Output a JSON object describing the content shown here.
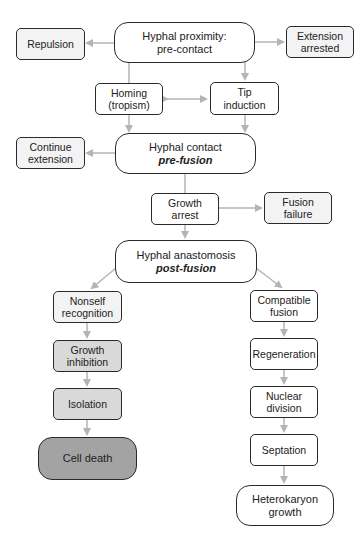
{
  "diagram": {
    "colors": {
      "arrow": "#b4b4b4",
      "border": "#2a2a2a",
      "fill_white": "#ffffff",
      "fill_light": "#f3f3f3",
      "fill_mid": "#d9d9d9",
      "fill_dark": "#a3a3a3"
    },
    "nodes": {
      "proximity": {
        "line1": "Hyphal proximity:",
        "line2": "pre-contact"
      },
      "repulsion": {
        "line1": "Repulsion"
      },
      "extension_arrested": {
        "line1": "Extension",
        "line2": "arrested"
      },
      "homing": {
        "line1": "Homing",
        "line2": "(tropism)"
      },
      "tip_induction": {
        "line1": "Tip",
        "line2": "induction"
      },
      "contact": {
        "line1": "Hyphal contact",
        "line2": "pre-fusion"
      },
      "continue_extension": {
        "line1": "Continue",
        "line2": "extension"
      },
      "growth_arrest": {
        "line1": "Growth",
        "line2": "arrest"
      },
      "fusion_failure": {
        "line1": "Fusion",
        "line2": "failure"
      },
      "anastomosis": {
        "line1": "Hyphal anastomosis",
        "line2": "post-fusion"
      },
      "nonself_recognition": {
        "line1": "Nonself",
        "line2": "recognition"
      },
      "compatible_fusion": {
        "line1": "Compatible",
        "line2": "fusion"
      },
      "growth_inhibition": {
        "line1": "Growth",
        "line2": "inhibition"
      },
      "regeneration": {
        "line1": "Regeneration"
      },
      "isolation": {
        "line1": "Isolation"
      },
      "nuclear_division": {
        "line1": "Nuclear",
        "line2": "division"
      },
      "cell_death": {
        "line1": "Cell death"
      },
      "septation": {
        "line1": "Septation"
      },
      "heterokaryon_growth": {
        "line1": "Heterokaryon",
        "line2": "growth"
      }
    },
    "edges": [
      {
        "from": "proximity",
        "to": "repulsion"
      },
      {
        "from": "proximity",
        "to": "extension_arrested"
      },
      {
        "from": "proximity",
        "to": "homing"
      },
      {
        "from": "proximity",
        "to": "tip_induction"
      },
      {
        "from": "homing",
        "to": "tip_induction",
        "bidirectional": true
      },
      {
        "from": "homing",
        "to": "contact"
      },
      {
        "from": "tip_induction",
        "to": "contact"
      },
      {
        "from": "contact",
        "to": "continue_extension"
      },
      {
        "from": "contact",
        "to": "growth_arrest"
      },
      {
        "from": "growth_arrest",
        "to": "fusion_failure"
      },
      {
        "from": "growth_arrest",
        "to": "anastomosis"
      },
      {
        "from": "anastomosis",
        "to": "nonself_recognition"
      },
      {
        "from": "anastomosis",
        "to": "compatible_fusion"
      },
      {
        "from": "nonself_recognition",
        "to": "growth_inhibition"
      },
      {
        "from": "growth_inhibition",
        "to": "isolation"
      },
      {
        "from": "isolation",
        "to": "cell_death"
      },
      {
        "from": "compatible_fusion",
        "to": "regeneration"
      },
      {
        "from": "regeneration",
        "to": "nuclear_division"
      },
      {
        "from": "nuclear_division",
        "to": "septation"
      },
      {
        "from": "septation",
        "to": "heterokaryon_growth"
      }
    ]
  }
}
